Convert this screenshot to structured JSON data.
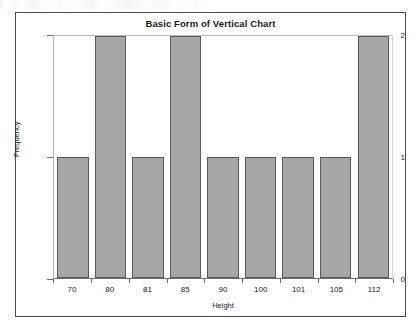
{
  "chart_data": {
    "type": "bar",
    "title": "Basic Form of Vertical Chart",
    "xlabel": "Height",
    "ylabel": "Frequency",
    "categories": [
      "70",
      "80",
      "81",
      "85",
      "90",
      "100",
      "101",
      "105",
      "112"
    ],
    "values": [
      1,
      2,
      1,
      2,
      1,
      1,
      1,
      1,
      2
    ],
    "ylim": [
      0,
      2
    ],
    "yticks": [
      "0",
      "1",
      "2"
    ],
    "grid": false,
    "legend": null,
    "colors": {
      "bar_fill": "#a6a6a6",
      "bar_border": "#595959",
      "text": "#1b1b1b",
      "frame": "#4a4a4a",
      "background": "#ffffff"
    }
  }
}
